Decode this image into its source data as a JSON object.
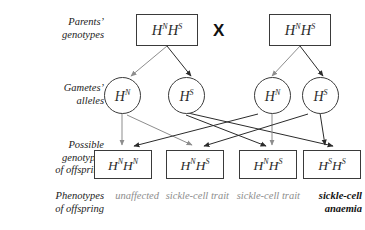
{
  "diagram": {
    "cross_symbol": "X",
    "colors": {
      "stroke_dark": "#2b2b2b",
      "stroke_light": "#8d8d8d",
      "text_dark": "#111111",
      "text_light": "#8d8d8d",
      "box_border": "#3a3a3a",
      "background": "#ffffff"
    }
  },
  "row_labels": {
    "parents": "Parents’\ngenotypes",
    "gametes": "Gametes’\nalleles",
    "genotypes": "Possible\ngenotypes\nof offspring",
    "phenotypes": "Phenotypes\nof offspring"
  },
  "parents": [
    {
      "allele1": "H",
      "sup1": "N",
      "allele2": "H",
      "sup2": "S"
    },
    {
      "allele1": "H",
      "sup1": "N",
      "allele2": "H",
      "sup2": "S"
    }
  ],
  "gametes": [
    {
      "allele": "H",
      "sup": "N"
    },
    {
      "allele": "H",
      "sup": "S"
    },
    {
      "allele": "H",
      "sup": "N"
    },
    {
      "allele": "H",
      "sup": "S"
    }
  ],
  "offspring_genotypes": [
    {
      "allele1": "H",
      "sup1": "N",
      "allele2": "H",
      "sup2": "N"
    },
    {
      "allele1": "H",
      "sup1": "N",
      "allele2": "H",
      "sup2": "S"
    },
    {
      "allele1": "H",
      "sup1": "N",
      "allele2": "H",
      "sup2": "S"
    },
    {
      "allele1": "H",
      "sup1": "S",
      "allele2": "H",
      "sup2": "S"
    }
  ],
  "offspring_phenotypes": [
    {
      "text": "unaffected",
      "emphasis": "light"
    },
    {
      "text": "sickle-cell trait",
      "emphasis": "light"
    },
    {
      "text": "sickle-cell trait",
      "emphasis": "light"
    },
    {
      "text": "sickle-cell anaemia",
      "emphasis": "dark"
    }
  ]
}
